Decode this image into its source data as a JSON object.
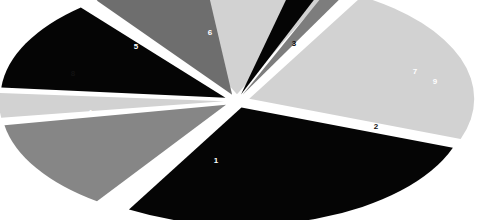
{
  "chart_data": {
    "type": "pie",
    "title": "",
    "subtitle": "",
    "xlabel": "",
    "ylabel": "",
    "legend": "none",
    "grid": false,
    "exploded": true,
    "labels_shown": "category-number",
    "categories": [
      "1",
      "2",
      "3",
      "4",
      "5",
      "6",
      "7",
      "8",
      "9"
    ],
    "values": [
      27.8,
      22.2,
      13.9,
      12.5,
      12.5,
      8.3,
      2.2,
      3.3,
      1.4
    ],
    "units": "percent",
    "slices": [
      {
        "label": "1",
        "value": 27.8,
        "color": "#050505",
        "label_color": "#ffffff",
        "start_angle": 110,
        "end_angle": 210,
        "explode": 13,
        "label_x": 216,
        "label_y": 161
      },
      {
        "label": "2",
        "value": 22.2,
        "color": "#d2d2d2",
        "label_color": "#111111",
        "start_angle": 30,
        "end_angle": 110,
        "explode": 13,
        "label_x": 376,
        "label_y": 127
      },
      {
        "label": "3",
        "value": 13.9,
        "color": "#d2d2d2",
        "label_color": "#111111",
        "start_angle": 335,
        "end_angle": 25,
        "explode": 13,
        "label_x": 294,
        "label_y": 44
      },
      {
        "label": "4",
        "value": 12.5,
        "color": "#868686",
        "label_color": "#ffffff",
        "start_angle": 215,
        "end_angle": 260,
        "explode": 13,
        "label_x": 90,
        "label_y": 113
      },
      {
        "label": "5",
        "value": 12.5,
        "color": "#050505",
        "label_color": "#ffffff",
        "start_angle": 275,
        "end_angle": 320,
        "explode": 13,
        "label_x": 136,
        "label_y": 47
      },
      {
        "label": "6",
        "value": 8.3,
        "color": "#6e6e6e",
        "label_color": "#ffffff",
        "start_angle": 323,
        "end_angle": 353,
        "explode": 13,
        "label_x": 210,
        "label_y": 33
      },
      {
        "label": "7",
        "value": 2.2,
        "color": "#050505",
        "label_color": "#ffffff",
        "start_angle": 14,
        "end_angle": 22,
        "explode": 13,
        "label_x": 415,
        "label_y": 72
      },
      {
        "label": "8",
        "value": 3.3,
        "color": "#d2d2d2",
        "label_color": "#111111",
        "start_angle": 262,
        "end_angle": 274,
        "explode": 13,
        "label_x": 73,
        "label_y": 74
      },
      {
        "label": "9",
        "value": 1.4,
        "color": "#7d7d7d",
        "label_color": "#ffffff",
        "start_angle": 23,
        "end_angle": 28,
        "explode": 13,
        "label_x": 435,
        "label_y": 82
      }
    ],
    "geometry": {
      "center_x": 237,
      "center_y": 101,
      "radius_x": 225,
      "radius_y": 118
    }
  }
}
